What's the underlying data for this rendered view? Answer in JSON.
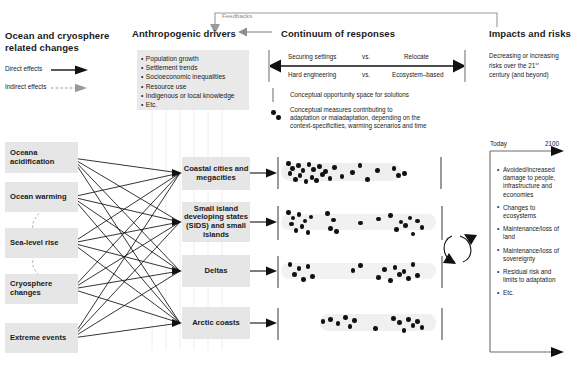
{
  "columns": {
    "left": {
      "title": "Ocean and cryosphere related changes",
      "legend": {
        "direct": "Direct effects",
        "indirect": "Indirect effects"
      },
      "changes": [
        "Oceana acidification",
        "Ocean warming",
        "Sea-level rise",
        "Cryosphere changes",
        "Extreme events"
      ]
    },
    "drivers": {
      "title": "Anthropogenic drivers",
      "items": [
        "Population growth",
        "Settlement trends",
        "Socioeconomic inequalities",
        "Resource use",
        "Indigenous or local knowledge",
        "Etc."
      ]
    },
    "responses": {
      "title": "Continuum of responses",
      "scale": {
        "top_left": "Securing settings",
        "top_mid": "vs.",
        "top_right": "Relocate",
        "bottom_left": "Hard engineering",
        "bottom_mid": "vs.",
        "bottom_right": "Ecosystem–based"
      },
      "legend_space": "Conceptual opportunity space for solutions",
      "legend_measures_l1": "Conceptual measures contributing to",
      "legend_measures_l2": "adaptation or maladaptation, depending on the",
      "legend_measures_l3": "context-specificities, warming scenarios and time"
    },
    "impacts": {
      "title": "Impacts and risks",
      "subtitle_l1": "Decreasing or increasing",
      "subtitle_l2": "risks over the 21",
      "subtitle_sup": "st",
      "subtitle_l3": "century (and beyond)",
      "axis_start": "Today",
      "axis_end": "2100",
      "items": [
        "Avoided/increased damage to people, infrastructure and economies",
        "Changes to ecosystems",
        "Maintenance/loss of land",
        "Maintenance/loss of sovereignty",
        "Residual risk and limits to adaptation",
        "Etc."
      ]
    }
  },
  "feedback_label": "Feedbacks",
  "systems": [
    "Coastal cities and megacities",
    "Small island developing states (SIDS) and small islands",
    "Deltas",
    "Arctic coasts"
  ],
  "colors": {
    "box_fill": "#e6e6e6",
    "dot": "#111111",
    "opportunity_bar": "#9a9a9a",
    "feedback_arrow": "#9a9a9a",
    "text": "#1a1a1a"
  },
  "chart_data": {
    "type": "scatter",
    "xlabel": "Securing settings / Hard engineering  ↔  Relocate / Ecosystem-based",
    "ylabel": "System",
    "xlim": [
      0,
      100
    ],
    "grid": false,
    "legend": "none",
    "series": [
      {
        "name": "Coastal cities and megacities",
        "points": [
          2,
          3,
          5,
          7,
          9,
          10,
          12,
          14,
          16,
          18,
          19,
          21,
          23,
          25,
          27,
          30,
          33,
          38,
          45,
          50,
          55,
          62,
          73,
          76,
          80
        ]
      },
      {
        "name": "Small island developing states (SIDS) and small islands",
        "points": [
          2,
          4,
          5,
          7,
          9,
          11,
          13,
          15,
          17,
          28,
          30,
          32,
          34,
          50,
          62,
          70,
          74,
          77,
          80,
          83,
          85,
          88,
          91
        ]
      },
      {
        "name": "Deltas",
        "points": [
          3,
          6,
          9,
          12,
          15,
          18,
          45,
          50,
          62,
          66,
          70,
          73,
          76,
          79,
          82,
          85,
          88
        ]
      },
      {
        "name": "Arctic coasts",
        "points": [
          25,
          30,
          35,
          40,
          43,
          46,
          60,
          72,
          76,
          79,
          82,
          85,
          88,
          91
        ]
      }
    ]
  }
}
